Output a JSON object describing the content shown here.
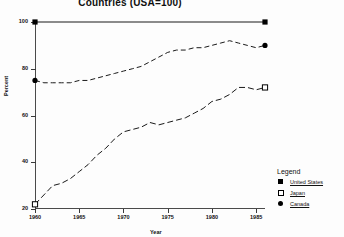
{
  "chart_data": {
    "type": "line",
    "title": "Countries (USA=100)",
    "xlabel": "Year",
    "ylabel": "Percent",
    "xlim": [
      1960,
      1986
    ],
    "ylim": [
      20,
      100
    ],
    "grid": false,
    "legend_position": "lower-right",
    "legend_title": "Legend",
    "xticks": [
      "1960",
      "1965",
      "1970",
      "1975",
      "1980",
      "1985"
    ],
    "xtick_values": [
      1960,
      1965,
      1970,
      1975,
      1980,
      1985
    ],
    "yticks": [
      "20",
      "40",
      "60",
      "80",
      "100"
    ],
    "ytick_values": [
      20,
      40,
      60,
      80,
      100
    ],
    "x": [
      1960,
      1961,
      1962,
      1963,
      1964,
      1965,
      1966,
      1967,
      1968,
      1969,
      1970,
      1971,
      1972,
      1973,
      1974,
      1975,
      1976,
      1977,
      1978,
      1979,
      1980,
      1981,
      1982,
      1983,
      1984,
      1985,
      1986
    ],
    "series": [
      {
        "name": "United States",
        "marker": "filled-square",
        "line": "solid",
        "values": [
          100,
          100,
          100,
          100,
          100,
          100,
          100,
          100,
          100,
          100,
          100,
          100,
          100,
          100,
          100,
          100,
          100,
          100,
          100,
          100,
          100,
          100,
          100,
          100,
          100,
          100,
          100
        ]
      },
      {
        "name": "Canada",
        "marker": "filled-circle",
        "line": "dashed",
        "values": [
          75,
          74,
          74,
          74,
          74,
          75,
          75,
          76,
          77,
          78,
          79,
          80,
          81,
          83,
          85,
          87,
          88,
          88,
          89,
          89,
          90,
          91,
          92,
          91,
          90,
          89,
          90
        ]
      },
      {
        "name": "Japan",
        "marker": "open-square",
        "line": "dash-dot",
        "values": [
          22,
          26,
          30,
          31,
          33,
          36,
          39,
          43,
          46,
          50,
          53,
          54,
          55,
          57,
          56,
          57,
          58,
          59,
          61,
          63,
          66,
          67,
          69,
          72,
          72,
          71,
          72
        ]
      }
    ]
  },
  "legend": {
    "title": "Legend",
    "entries": [
      {
        "label": "United States",
        "marker": "filled-square"
      },
      {
        "label": "Japan",
        "marker": "open-square"
      },
      {
        "label": "Canada",
        "marker": "filled-circle"
      }
    ]
  }
}
